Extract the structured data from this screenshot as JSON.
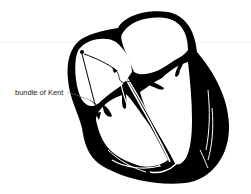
{
  "figure": {
    "annotations": [
      {
        "label": "bundle of Kent"
      }
    ]
  },
  "colors": {
    "ink": "#000000",
    "background": "#ffffff",
    "label_text": "#222222"
  }
}
